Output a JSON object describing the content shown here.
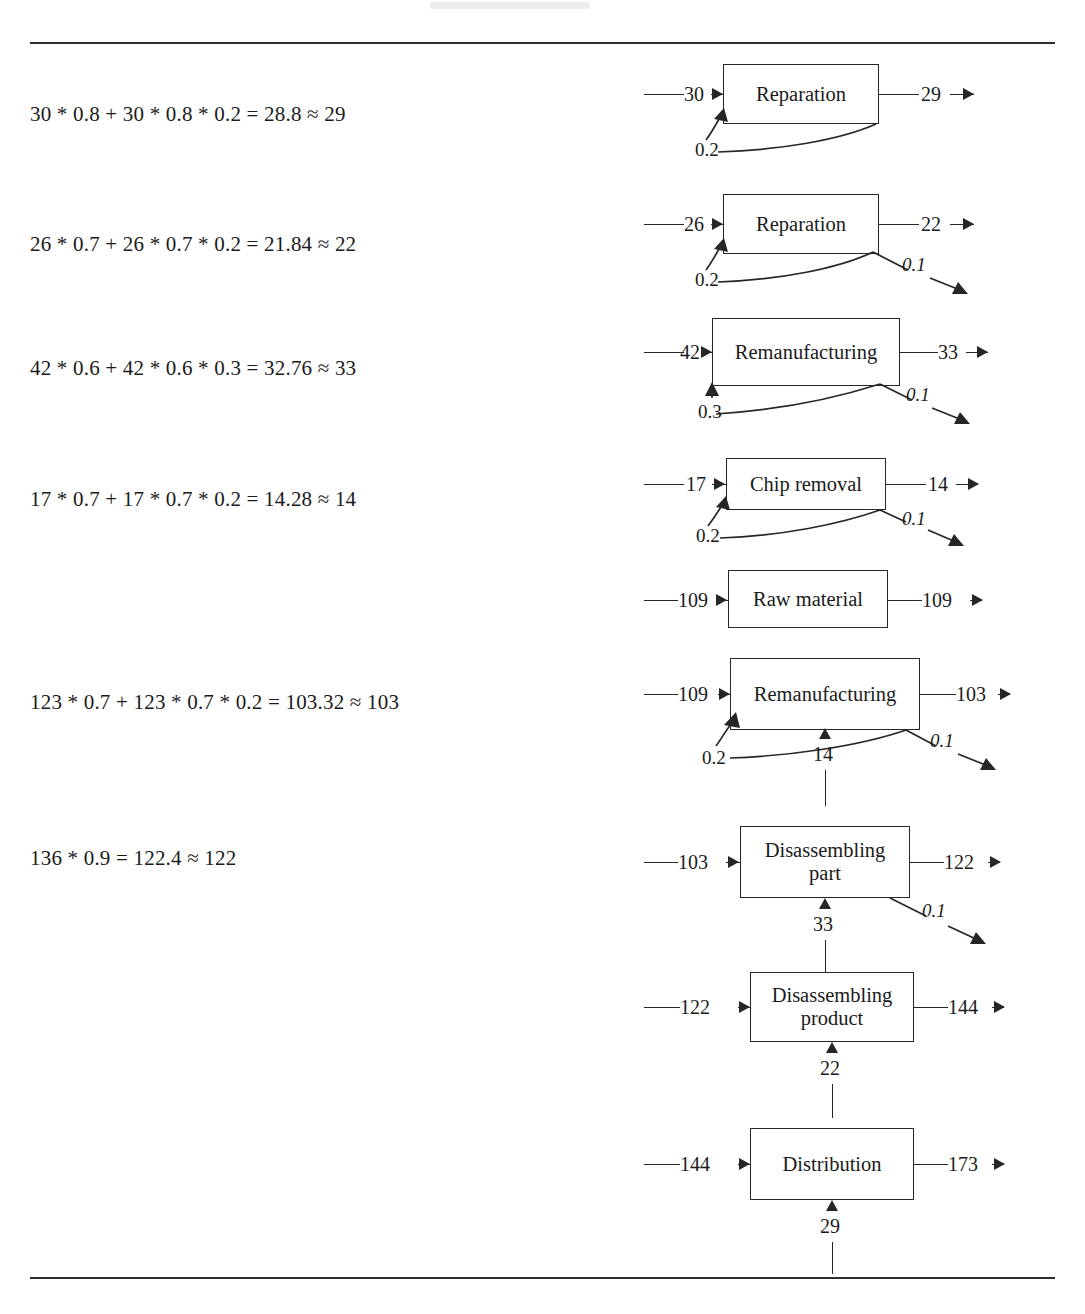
{
  "page": {
    "rules": [
      "top-rule",
      "bottom-rule"
    ]
  },
  "formulas": [
    {
      "id": "formula-reparation-30",
      "text": "30 * 0.8 + 30 * 0.8 * 0.2 = 28.8 ≈ 29",
      "top": 104
    },
    {
      "id": "formula-reparation-26",
      "text": "26 * 0.7 + 26 * 0.7 * 0.2 = 21.84 ≈ 22",
      "top": 234
    },
    {
      "id": "formula-remanufacturing-42",
      "text": "42 * 0.6 + 42 * 0.6 * 0.3 = 32.76 ≈ 33",
      "top": 358
    },
    {
      "id": "formula-chip-removal-17",
      "text": "17 * 0.7 + 17 * 0.7 * 0.2 = 14.28 ≈ 14",
      "top": 489
    },
    {
      "id": "formula-remanufacturing-123",
      "text": "123 * 0.7 + 123 * 0.7 * 0.2 = 103.32 ≈ 103",
      "top": 692
    },
    {
      "id": "formula-disassembling-136",
      "text": "136 * 0.9 = 122.4 ≈ 122",
      "top": 848
    }
  ],
  "process_blocks": [
    {
      "id": "block-reparation-1",
      "label": "Reparation",
      "input": "30",
      "output": "29",
      "feedback": "0.2",
      "loss": null,
      "vertical_input": null
    },
    {
      "id": "block-reparation-2",
      "label": "Reparation",
      "input": "26",
      "output": "22",
      "feedback": "0.2",
      "loss": "0.1",
      "vertical_input": null
    },
    {
      "id": "block-remanufacturing-1",
      "label": "Remanufacturing",
      "input": "42",
      "output": "33",
      "feedback": "0.3",
      "loss": "0.1",
      "vertical_input": null
    },
    {
      "id": "block-chip-removal",
      "label": "Chip removal",
      "input": "17",
      "output": "14",
      "feedback": "0.2",
      "loss": "0.1",
      "vertical_input": null
    },
    {
      "id": "block-raw-material",
      "label": "Raw material",
      "input": "109",
      "output": "109",
      "feedback": null,
      "loss": null,
      "vertical_input": null
    },
    {
      "id": "block-remanufacturing-2",
      "label": "Remanufacturing",
      "input": "109",
      "output": "103",
      "feedback": "0.2",
      "loss": "0.1",
      "vertical_input": "14"
    },
    {
      "id": "block-disassembling-part",
      "label": "Disassembling part",
      "label_line1": "Disassembling",
      "label_line2": "part",
      "input": "103",
      "output": "122",
      "feedback": null,
      "loss": "0.1",
      "vertical_input": "33"
    },
    {
      "id": "block-disassembling-product",
      "label": "Disassembling product",
      "label_line1": "Disassembling",
      "label_line2": "product",
      "input": "122",
      "output": "144",
      "feedback": null,
      "loss": null,
      "vertical_input": "22"
    },
    {
      "id": "block-distribution",
      "label": "Distribution",
      "input": "144",
      "output": "173",
      "feedback": null,
      "loss": null,
      "vertical_input": "29"
    }
  ]
}
